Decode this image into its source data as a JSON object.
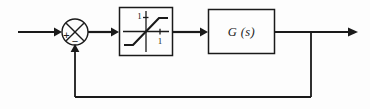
{
  "diagram": {
    "type": "control-block-diagram",
    "background_color": "#fdfdfd",
    "line_color": "#1a1a1a",
    "summing_junction": {
      "name": "summing-junction",
      "shape": "circle-with-cross",
      "plus_sign": "+",
      "minus_sign": "−",
      "plus_position": "left",
      "minus_position": "bottom",
      "center_x": 75,
      "center_y": 32,
      "radius": 13
    },
    "blocks": [
      {
        "name": "saturation-block",
        "label": "",
        "kind": "saturation-nonlinearity",
        "x": 119,
        "y": 7,
        "width": 54,
        "height": 49,
        "axis_labels": {
          "vertical": "1",
          "horizontal": "1"
        }
      },
      {
        "name": "plant-block",
        "label": "G (s)",
        "kind": "transfer-function",
        "x": 208,
        "y": 9,
        "width": 67,
        "height": 45
      }
    ],
    "signals": [
      {
        "name": "input-signal",
        "label": "",
        "from": "left-edge",
        "to": "summing-junction"
      },
      {
        "name": "error-signal",
        "label": "",
        "from": "summing-junction",
        "to": "saturation-block"
      },
      {
        "name": "saturated-signal",
        "label": "",
        "from": "saturation-block",
        "to": "plant-block"
      },
      {
        "name": "output-signal",
        "label": "",
        "from": "plant-block",
        "to": "right-edge"
      },
      {
        "name": "feedback-signal",
        "label": "",
        "from": "output-tap",
        "to": "summing-junction"
      }
    ],
    "feedback": {
      "name": "feedback-path",
      "tap_x": 311,
      "bottom_y": 97,
      "return_x": 75,
      "type": "unity-negative-feedback"
    }
  }
}
